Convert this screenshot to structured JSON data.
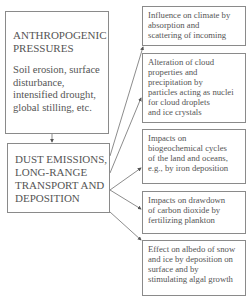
{
  "diagram": {
    "source": {
      "title_lines": [
        "ANTHROPOGENIC",
        "PRESSURES"
      ],
      "body_lines": [
        "Soil erosion, surface",
        "disturbance,",
        "intensified drought,",
        "global stilling, etc."
      ]
    },
    "center": {
      "lines": [
        "DUST EMISSIONS,",
        "LONG-RANGE",
        "TRANSPORT AND",
        "DEPOSITION"
      ]
    },
    "effects": [
      {
        "lines": [
          "Influence on climate by",
          "absorption and",
          "scattering of incoming"
        ]
      },
      {
        "lines": [
          "Alteration of cloud",
          "properties and",
          "precipitation by",
          "particles acting as nuclei",
          "for cloud droplets",
          "and ice crystals"
        ]
      },
      {
        "lines": [
          "Impacts on",
          "biogeochemical cycles",
          "of the land and oceans,",
          "e.g., by iron deposition"
        ]
      },
      {
        "lines": [
          "Impacts on drawdown",
          "of carbon dioxide by",
          "fertilizing plankton"
        ]
      },
      {
        "lines": [
          "Effect on albedo of snow",
          "and ice by deposition on",
          "surface and by",
          "stimulating algal growth"
        ]
      }
    ],
    "colors": {
      "line": "#6e6e6e",
      "border": "#8a8a8a",
      "text": "#555555"
    }
  }
}
